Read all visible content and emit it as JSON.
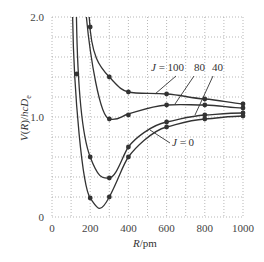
{
  "chart_data": {
    "type": "line",
    "title": "",
    "xlabel": "R/pm",
    "ylabel": "V(R)/hcD_e",
    "xlim": [
      0,
      1000
    ],
    "ylim": [
      0,
      2.0
    ],
    "x_ticks": [
      "0",
      "200",
      "400",
      "600",
      "800",
      "1000"
    ],
    "y_ticks": [
      "0",
      "1.0",
      "2.0"
    ],
    "grid": true,
    "legend_position": "inline annotations",
    "series": [
      {
        "name": "J = 100",
        "points": [
          [
            200,
            1.9
          ],
          [
            300,
            1.4
          ],
          [
            400,
            1.25
          ],
          [
            600,
            1.23
          ],
          [
            800,
            1.18
          ],
          [
            1000,
            1.13
          ]
        ]
      },
      {
        "name": "80",
        "points": [
          [
            300,
            0.98
          ],
          [
            400,
            1.02
          ],
          [
            600,
            1.12
          ],
          [
            800,
            1.12
          ],
          [
            1000,
            1.09
          ]
        ]
      },
      {
        "name": "40",
        "points": [
          [
            130,
            1.43
          ],
          [
            200,
            0.6
          ],
          [
            300,
            0.39
          ],
          [
            400,
            0.7
          ],
          [
            600,
            0.95
          ],
          [
            800,
            1.02
          ],
          [
            1000,
            1.04
          ]
        ]
      },
      {
        "name": "J = 0",
        "points": [
          [
            200,
            0.19
          ],
          [
            300,
            0.2
          ],
          [
            400,
            0.6
          ],
          [
            600,
            0.9
          ],
          [
            800,
            0.98
          ],
          [
            1000,
            1.01
          ]
        ]
      }
    ],
    "annotations": [
      "J = 100",
      "80",
      "40",
      "J = 0"
    ]
  },
  "axes": {
    "xlabel_R": "R",
    "xlabel_unit": "/pm",
    "ylabel_text": "V(R)/hcD",
    "ylabel_sub": "e"
  },
  "labels": {
    "j100": "J = 100",
    "j80": "80",
    "j40": "40",
    "j0": "J = 0"
  }
}
